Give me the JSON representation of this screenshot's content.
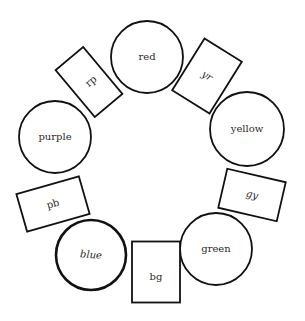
{
  "diagram": {
    "title": "",
    "circles": [
      {
        "id": "red",
        "label": "red",
        "cx": 147,
        "cy": 57,
        "r": 36,
        "italic": false,
        "thick": false
      },
      {
        "id": "yellow",
        "label": "yellow",
        "cx": 247,
        "cy": 129,
        "r": 37,
        "italic": false,
        "thick": false
      },
      {
        "id": "green",
        "label": "green",
        "cx": 216,
        "cy": 249,
        "r": 36,
        "italic": false,
        "thick": false
      },
      {
        "id": "blue",
        "label": "blue",
        "cx": 91,
        "cy": 255,
        "r": 35,
        "italic": true,
        "thick": true
      },
      {
        "id": "purple",
        "label": "purple",
        "cx": 55,
        "cy": 137,
        "r": 36,
        "italic": false,
        "thick": false
      }
    ],
    "rects": [
      {
        "id": "yr",
        "label": "yr",
        "cx": 207,
        "cy": 76,
        "w": 44,
        "h": 61,
        "rotate": 32,
        "italic": true
      },
      {
        "id": "gy",
        "label": "gy",
        "cx": 252,
        "cy": 195,
        "w": 60,
        "h": 40,
        "rotate": 13,
        "italic": true
      },
      {
        "id": "bg",
        "label": "bg",
        "cx": 156,
        "cy": 272,
        "w": 48,
        "h": 61,
        "rotate": 0,
        "italic": false
      },
      {
        "id": "pb",
        "label": "pb",
        "cx": 53,
        "cy": 204,
        "w": 65,
        "h": 39,
        "rotate": -16,
        "italic": false
      },
      {
        "id": "rp",
        "label": "rp",
        "cx": 89,
        "cy": 82,
        "w": 36,
        "h": 61,
        "rotate": -40,
        "italic": false
      }
    ],
    "colors": {
      "stroke": "#111111",
      "background": "#ffffff",
      "text": "#2a2a2a"
    }
  }
}
